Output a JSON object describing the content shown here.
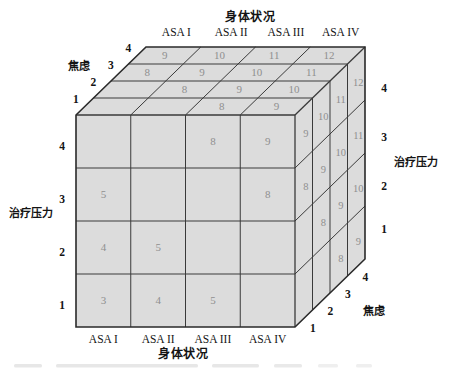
{
  "figure": {
    "titles": {
      "top": "身体状况",
      "bottom": "身体状况"
    },
    "axes": {
      "physical_status": {
        "label": "身体状况",
        "ticks": [
          "ASA I",
          "ASA II",
          "ASA III",
          "ASA IV"
        ]
      },
      "anxiety": {
        "label": "焦虑",
        "ticks": [
          "1",
          "2",
          "3",
          "4"
        ]
      },
      "treatment_stress": {
        "label": "治疗压力",
        "ticks": [
          "1",
          "2",
          "3",
          "4"
        ]
      }
    },
    "faces": {
      "front": {
        "rows": [
          [
            null,
            null,
            8,
            9
          ],
          [
            5,
            null,
            null,
            8
          ],
          [
            4,
            5,
            null,
            null
          ],
          [
            3,
            4,
            5,
            null
          ]
        ]
      },
      "top": {
        "rows": [
          [
            9,
            10,
            11,
            12
          ],
          [
            8,
            9,
            10,
            11
          ],
          [
            null,
            8,
            9,
            10
          ],
          [
            null,
            null,
            8,
            9
          ]
        ]
      },
      "right": {
        "rows": [
          [
            9,
            10,
            11,
            12
          ],
          [
            8,
            9,
            10,
            11
          ],
          [
            null,
            8,
            9,
            10
          ],
          [
            null,
            null,
            8,
            9
          ]
        ]
      }
    },
    "colors": {
      "face": "#dcdcdc",
      "edge": "#2a2a2a",
      "grid": "#3a3a3a",
      "value": "#8f8f8f",
      "text": "#141414",
      "background": "#ffffff",
      "remnant": "#c9c9c9"
    }
  }
}
